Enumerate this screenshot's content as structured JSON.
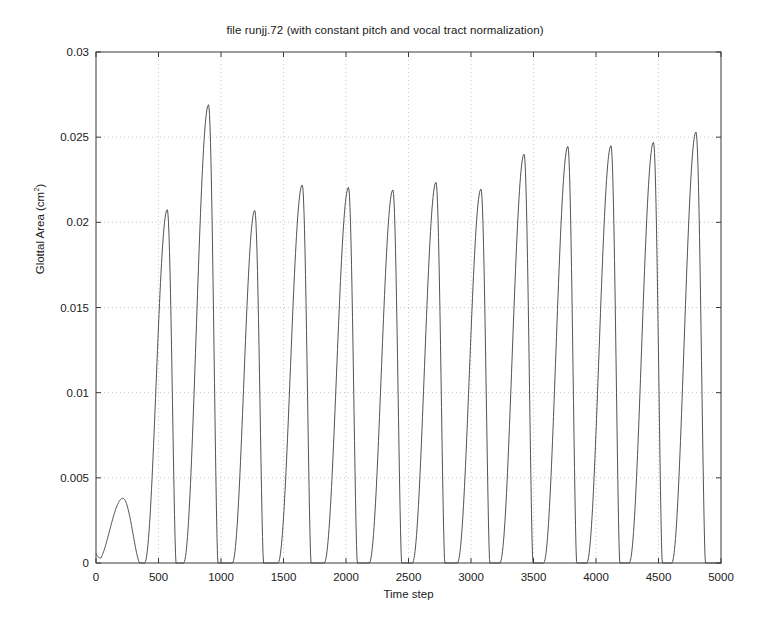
{
  "chart_data": {
    "type": "line",
    "title": "file runjj.72 (with constant pitch and vocal tract normalization)",
    "xlabel": "Time step",
    "ylabel_text": "Glottal Area (cm",
    "ylabel_sup": "2",
    "ylabel_tail": ")",
    "ylabel_full": "Glottal Area (cm2)",
    "xlim": [
      0,
      5000
    ],
    "ylim": [
      0,
      0.03
    ],
    "grid": true,
    "grid_style": "dotted",
    "legend": "none",
    "xticks": [
      0,
      500,
      1000,
      1500,
      2000,
      2500,
      3000,
      3500,
      4000,
      4500,
      5000
    ],
    "xticklabels": [
      "0",
      "500",
      "1000",
      "1500",
      "2000",
      "2500",
      "3000",
      "3500",
      "4000",
      "4500",
      "5000"
    ],
    "yticks": [
      0,
      0.005,
      0.01,
      0.015,
      0.02,
      0.025,
      0.03
    ],
    "yticklabels": [
      "0",
      "0.005",
      "0.01",
      "0.015",
      "0.02",
      "0.025",
      "0.03"
    ],
    "line_color": "#404040",
    "line_width": 0.9,
    "series": [
      {
        "name": "Glottal Area",
        "description": "Glottal area waveform: one small initial pulse followed by 14 full-amplitude glottal pulses of slowly increasing amplitude.",
        "pulses": [
          {
            "index": 0,
            "peak_time": 215,
            "peak_value": 0.0038,
            "onset": 0,
            "offset": 350
          },
          {
            "index": 1,
            "peak_time": 570,
            "peak_value": 0.02075,
            "onset": 388,
            "offset": 640
          },
          {
            "index": 2,
            "peak_time": 900,
            "peak_value": 0.0269,
            "onset": 700,
            "offset": 975
          },
          {
            "index": 3,
            "peak_time": 1270,
            "peak_value": 0.0207,
            "onset": 1090,
            "offset": 1340
          },
          {
            "index": 4,
            "peak_time": 1650,
            "peak_value": 0.0222,
            "onset": 1455,
            "offset": 1720
          },
          {
            "index": 5,
            "peak_time": 2020,
            "peak_value": 0.02205,
            "onset": 1825,
            "offset": 2090
          },
          {
            "index": 6,
            "peak_time": 2375,
            "peak_value": 0.0219,
            "onset": 2185,
            "offset": 2445
          },
          {
            "index": 7,
            "peak_time": 2720,
            "peak_value": 0.02235,
            "onset": 2530,
            "offset": 2790
          },
          {
            "index": 8,
            "peak_time": 3080,
            "peak_value": 0.02195,
            "onset": 2890,
            "offset": 3150
          },
          {
            "index": 9,
            "peak_time": 3425,
            "peak_value": 0.024,
            "onset": 3230,
            "offset": 3495
          },
          {
            "index": 10,
            "peak_time": 3775,
            "peak_value": 0.02445,
            "onset": 3580,
            "offset": 3845
          },
          {
            "index": 11,
            "peak_time": 4120,
            "peak_value": 0.0245,
            "onset": 3925,
            "offset": 4190
          },
          {
            "index": 12,
            "peak_time": 4460,
            "peak_value": 0.0247,
            "onset": 4265,
            "offset": 4530
          },
          {
            "index": 13,
            "peak_time": 4800,
            "peak_value": 0.0253,
            "onset": 4605,
            "offset": 4875
          }
        ]
      }
    ]
  }
}
